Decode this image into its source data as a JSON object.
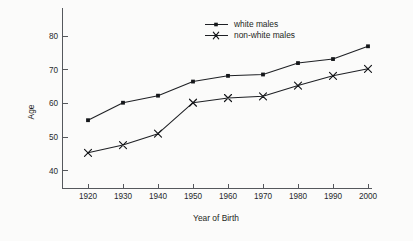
{
  "chart_data": {
    "type": "line",
    "title": "",
    "xlabel": "Year of Birth",
    "ylabel": "Age",
    "x": [
      1920,
      1930,
      1940,
      1950,
      1960,
      1970,
      1980,
      1990,
      2000
    ],
    "xticklabels": [
      "1920",
      "1930",
      "1940",
      "1950",
      "1960",
      "1970",
      "1980",
      "1990",
      "2000"
    ],
    "yticklabels": [
      "40",
      "50",
      "60",
      "70",
      "80"
    ],
    "yticks": [
      40,
      50,
      60,
      70,
      80
    ],
    "xlim": [
      1913,
      2004
    ],
    "ylim": [
      36,
      84
    ],
    "grid": false,
    "legend_position": "top-center",
    "series": [
      {
        "name": "white males",
        "marker": "square",
        "color": "#15171a",
        "values": [
          55.0,
          60.2,
          62.3,
          66.5,
          68.2,
          68.6,
          72.0,
          73.2,
          77.0
        ]
      },
      {
        "name": "non-white males",
        "marker": "x",
        "color": "#15171a",
        "values": [
          45.3,
          47.6,
          51.0,
          60.2,
          61.6,
          62.1,
          65.3,
          68.2,
          70.3
        ]
      }
    ]
  },
  "legend": {
    "entries": [
      {
        "label": "white males"
      },
      {
        "label": "non-white males"
      }
    ]
  }
}
